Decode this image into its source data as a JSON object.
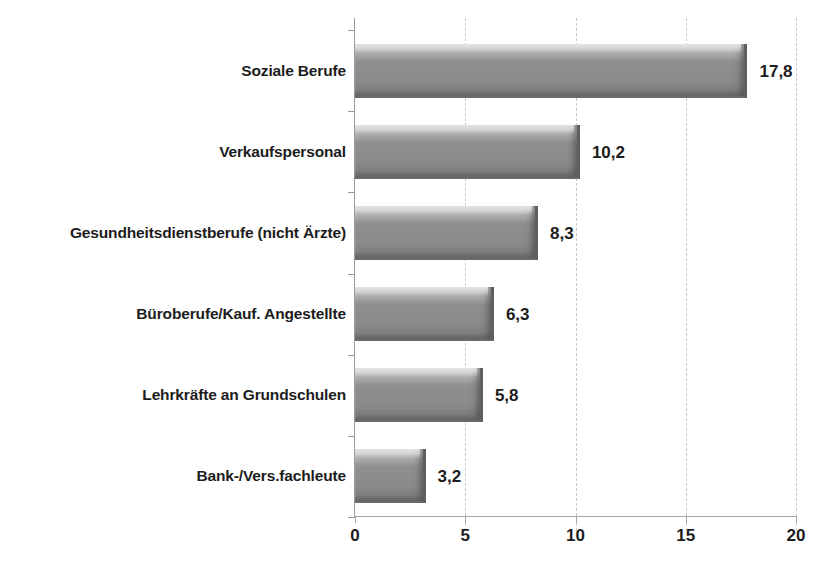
{
  "chart_data": {
    "type": "bar",
    "orientation": "horizontal",
    "title": "",
    "subtitle": "",
    "xlabel": "",
    "ylabel": "",
    "xlim": [
      0,
      20
    ],
    "ylim": null,
    "grid": "vertical-dashed",
    "legend": "none",
    "xticks": [
      "0",
      "5",
      "10",
      "15",
      "20"
    ],
    "xtick_values": [
      0,
      5,
      10,
      15,
      20
    ],
    "categories": [
      "Soziale Berufe",
      "Verkaufspersonal",
      "Gesundheitsdienstberufe (nicht Ärzte)",
      "Büroberufe/Kauf. Angestellte",
      "Lehrkräfte an Grundschulen",
      "Bank-/Vers.fachleute"
    ],
    "values": [
      17.8,
      10.2,
      8.3,
      6.3,
      5.8,
      3.2
    ],
    "value_labels": [
      "17,8",
      "10,2",
      "8,3",
      "6,3",
      "5,8",
      "3,2"
    ],
    "bar_color": "#8f8f8f",
    "bar_edge_color": "#5f5f5f",
    "grid_color": "#c9c9c9",
    "axis_color": "#9a9a9a",
    "text_color": "#1c1c1c",
    "background_color": "#ffffff"
  }
}
